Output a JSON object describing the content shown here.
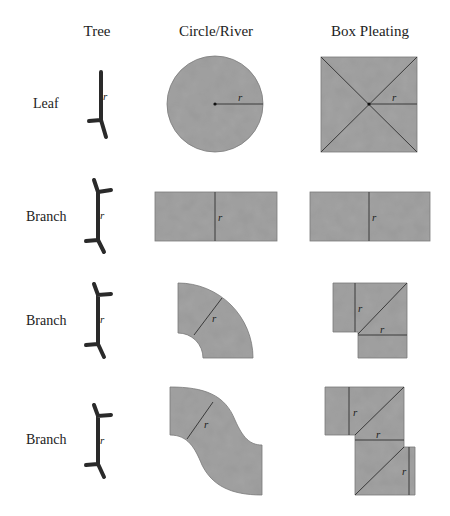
{
  "columns": [
    {
      "label": "Tree",
      "x": 101
    },
    {
      "label": "Circle/River",
      "x": 216
    },
    {
      "label": "Box Pleating",
      "x": 369
    }
  ],
  "rows": [
    {
      "label": "Leaf",
      "y": 103
    },
    {
      "label": "Branch",
      "y": 217
    },
    {
      "label": "Branch",
      "y": 320
    },
    {
      "label": "Branch",
      "y": 440
    }
  ],
  "radius_label": "r",
  "colors": {
    "paper": "#9a9a9a",
    "crease": "#3a3a3a",
    "tree": "#2a2a2a",
    "text": "#222222"
  }
}
